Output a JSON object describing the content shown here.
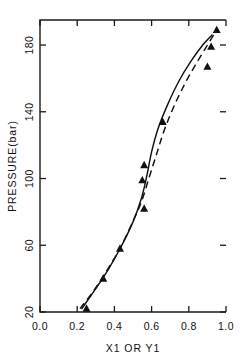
{
  "chart_data": {
    "type": "scatter",
    "title": "",
    "xlabel": "X1  OR  Y1",
    "ylabel": "PRESSURE(bar)",
    "xlim": [
      0.0,
      1.0
    ],
    "ylim": [
      20,
      195
    ],
    "xticks": [
      0.0,
      0.2,
      0.4,
      0.6,
      0.8,
      1.0
    ],
    "xticklabels": [
      "0.0",
      "0.2",
      "0.4",
      "0.6",
      "0.8",
      "1.0"
    ],
    "yticks": [
      20,
      60,
      100,
      140,
      180
    ],
    "yticklabels": [
      "20",
      "60",
      "100",
      "140",
      "180"
    ],
    "grid": false,
    "legend": "none",
    "series": [
      {
        "name": "experimental-points",
        "style": "triangle-marker",
        "points": [
          {
            "x": 0.25,
            "y": 22
          },
          {
            "x": 0.34,
            "y": 40
          },
          {
            "x": 0.43,
            "y": 58
          },
          {
            "x": 0.56,
            "y": 82
          },
          {
            "x": 0.55,
            "y": 99
          },
          {
            "x": 0.56,
            "y": 108
          },
          {
            "x": 0.66,
            "y": 134
          },
          {
            "x": 0.9,
            "y": 167
          },
          {
            "x": 0.92,
            "y": 179
          },
          {
            "x": 0.95,
            "y": 189
          }
        ]
      },
      {
        "name": "bubble-curve-solid",
        "style": "solid-line",
        "points": [
          {
            "x": 0.225,
            "y": 22
          },
          {
            "x": 0.3,
            "y": 34
          },
          {
            "x": 0.37,
            "y": 46
          },
          {
            "x": 0.44,
            "y": 60
          },
          {
            "x": 0.5,
            "y": 74
          },
          {
            "x": 0.545,
            "y": 88
          },
          {
            "x": 0.575,
            "y": 102
          },
          {
            "x": 0.6,
            "y": 116
          },
          {
            "x": 0.635,
            "y": 130
          },
          {
            "x": 0.685,
            "y": 144
          },
          {
            "x": 0.745,
            "y": 158
          },
          {
            "x": 0.81,
            "y": 170
          },
          {
            "x": 0.875,
            "y": 180
          },
          {
            "x": 0.925,
            "y": 186
          }
        ]
      },
      {
        "name": "dew-curve-dashed",
        "style": "dashed-line",
        "points": [
          {
            "x": 0.215,
            "y": 22
          },
          {
            "x": 0.29,
            "y": 33
          },
          {
            "x": 0.36,
            "y": 45
          },
          {
            "x": 0.43,
            "y": 58
          },
          {
            "x": 0.49,
            "y": 72
          },
          {
            "x": 0.545,
            "y": 86
          },
          {
            "x": 0.585,
            "y": 100
          },
          {
            "x": 0.625,
            "y": 114
          },
          {
            "x": 0.665,
            "y": 128
          },
          {
            "x": 0.715,
            "y": 142
          },
          {
            "x": 0.775,
            "y": 156
          },
          {
            "x": 0.835,
            "y": 168
          },
          {
            "x": 0.895,
            "y": 179
          },
          {
            "x": 0.945,
            "y": 188
          }
        ]
      }
    ]
  }
}
